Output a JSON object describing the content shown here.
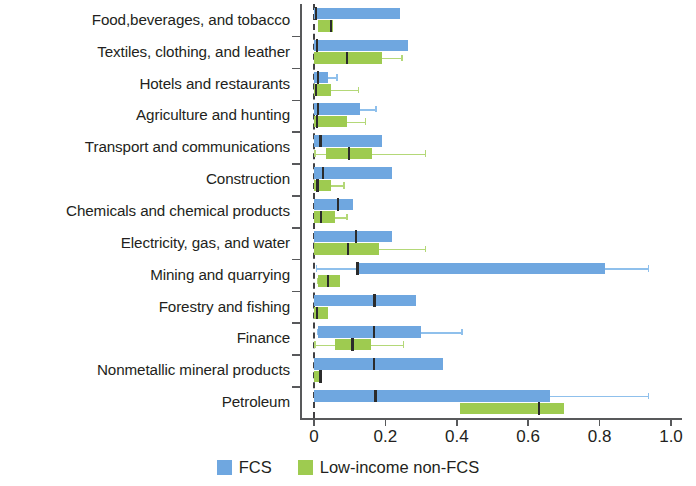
{
  "chart_data": {
    "type": "box",
    "title": "",
    "xlabel": "",
    "ylabel": "",
    "xlim": [
      0.0,
      1.0
    ],
    "xticks": [
      0,
      0.2,
      0.4,
      0.6,
      0.8,
      1.0
    ],
    "xtick_labels": [
      "0",
      "0.2",
      "0.4",
      "0.6",
      "0.8",
      "1.0"
    ],
    "grid": false,
    "legend_position": "bottom-center",
    "orientation": "horizontal",
    "zero_reference_line": 0.0,
    "categories": [
      "Food,beverages, and tobacco",
      "Textiles, clothing, and leather",
      "Hotels and restaurants",
      "Agriculture and hunting",
      "Transport and communications",
      "Construction",
      "Chemicals and chemical products",
      "Electricity, gas, and water",
      "Mining and quarrying",
      "Forestry and fishing",
      "Finance",
      "Nonmetallic mineral products",
      "Petroleum"
    ],
    "series": [
      {
        "name": "FCS",
        "color": "#6fa7e0",
        "whisker_color": "#8fc0ec",
        "boxes": [
          {
            "category": "Food,beverages, and tobacco",
            "whisker_low": 0.0,
            "q1": 0.0,
            "median": 0.005,
            "q3": 0.24,
            "whisker_high": 0.24
          },
          {
            "category": "Textiles, clothing, and leather",
            "whisker_low": 0.0,
            "q1": 0.0,
            "median": 0.008,
            "q3": 0.262,
            "whisker_high": 0.262
          },
          {
            "category": "Hotels and restaurants",
            "whisker_low": 0.0,
            "q1": 0.0,
            "median": 0.012,
            "q3": 0.038,
            "whisker_high": 0.062
          },
          {
            "category": "Agriculture and hunting",
            "whisker_low": 0.0,
            "q1": 0.0,
            "median": 0.012,
            "q3": 0.128,
            "whisker_high": 0.172
          },
          {
            "category": "Transport and communications",
            "whisker_low": 0.0,
            "q1": 0.0,
            "median": 0.018,
            "q3": 0.19,
            "whisker_high": 0.19
          },
          {
            "category": "Construction",
            "whisker_low": 0.0,
            "q1": 0.0,
            "median": 0.025,
            "q3": 0.218,
            "whisker_high": 0.218
          },
          {
            "category": "Chemicals and chemical products",
            "whisker_low": 0.0,
            "q1": 0.0,
            "median": 0.068,
            "q3": 0.11,
            "whisker_high": 0.11
          },
          {
            "category": "Electricity, gas, and water",
            "whisker_low": 0.0,
            "q1": 0.0,
            "median": 0.118,
            "q3": 0.218,
            "whisker_high": 0.218
          },
          {
            "category": "Mining and quarrying",
            "whisker_low": 0.005,
            "q1": 0.118,
            "median": 0.122,
            "q3": 0.815,
            "whisker_high": 0.935
          },
          {
            "category": "Forestry and fishing",
            "whisker_low": 0.0,
            "q1": 0.0,
            "median": 0.17,
            "q3": 0.285,
            "whisker_high": 0.285
          },
          {
            "category": "Finance",
            "whisker_low": 0.008,
            "q1": 0.012,
            "median": 0.168,
            "q3": 0.3,
            "whisker_high": 0.412
          },
          {
            "category": "Nonmetallic mineral products",
            "whisker_low": 0.0,
            "q1": 0.0,
            "median": 0.168,
            "q3": 0.362,
            "whisker_high": 0.362
          },
          {
            "category": "Petroleum",
            "whisker_low": 0.0,
            "q1": 0.0,
            "median": 0.172,
            "q3": 0.66,
            "whisker_high": 0.935
          }
        ]
      },
      {
        "name": "Low-income non-FCS",
        "color": "#9ecb50",
        "whisker_color": "#b4d878",
        "boxes": [
          {
            "category": "Food,beverages, and tobacco",
            "whisker_low": 0.012,
            "q1": 0.012,
            "median": 0.048,
            "q3": 0.052,
            "whisker_high": 0.052
          },
          {
            "category": "Textiles, clothing, and leather",
            "whisker_low": 0.0,
            "q1": 0.0,
            "median": 0.092,
            "q3": 0.19,
            "whisker_high": 0.245
          },
          {
            "category": "Hotels and restaurants",
            "whisker_low": 0.0,
            "q1": 0.0,
            "median": 0.005,
            "q3": 0.048,
            "whisker_high": 0.122
          },
          {
            "category": "Agriculture and hunting",
            "whisker_low": 0.0,
            "q1": 0.0,
            "median": 0.008,
            "q3": 0.092,
            "whisker_high": 0.142
          },
          {
            "category": "Transport and communications",
            "whisker_low": 0.0,
            "q1": 0.035,
            "median": 0.098,
            "q3": 0.162,
            "whisker_high": 0.31
          },
          {
            "category": "Construction",
            "whisker_low": 0.0,
            "q1": 0.0,
            "median": 0.01,
            "q3": 0.048,
            "whisker_high": 0.082
          },
          {
            "category": "Chemicals and chemical products",
            "whisker_low": 0.0,
            "q1": 0.0,
            "median": 0.02,
            "q3": 0.058,
            "whisker_high": 0.09
          },
          {
            "category": "Electricity, gas, and water",
            "whisker_low": 0.0,
            "q1": 0.0,
            "median": 0.095,
            "q3": 0.182,
            "whisker_high": 0.31
          },
          {
            "category": "Mining and quarrying",
            "whisker_low": 0.008,
            "q1": 0.012,
            "median": 0.04,
            "q3": 0.072,
            "whisker_high": 0.072
          },
          {
            "category": "Forestry and fishing",
            "whisker_low": 0.0,
            "q1": 0.0,
            "median": 0.008,
            "q3": 0.04,
            "whisker_high": 0.04
          },
          {
            "category": "Finance",
            "whisker_low": 0.0,
            "q1": 0.058,
            "median": 0.108,
            "q3": 0.16,
            "whisker_high": 0.248
          },
          {
            "category": "Nonmetallic mineral products",
            "whisker_low": 0.0,
            "q1": 0.0,
            "median": 0.018,
            "q3": 0.022,
            "whisker_high": 0.022
          },
          {
            "category": "Petroleum",
            "whisker_low": 0.41,
            "q1": 0.41,
            "median": 0.63,
            "q3": 0.7,
            "whisker_high": 0.7
          }
        ]
      }
    ]
  },
  "legend": {
    "items": [
      {
        "label": "FCS",
        "color": "#6fa7e0"
      },
      {
        "label": "Low-income non-FCS",
        "color": "#9ecb50"
      }
    ]
  }
}
